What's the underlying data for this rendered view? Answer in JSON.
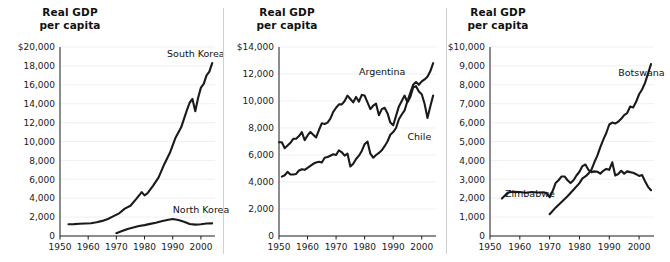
{
  "figure": {
    "background": "#ffffff",
    "line_color": "#1a1a1a",
    "grid_color": "#e9e9ef",
    "axis_color": "#1a1a1a"
  },
  "panels": [
    {
      "id": "korea",
      "title": "Real GDP\nper capita",
      "chart_data": {
        "type": "line",
        "title": "Real GDP per capita",
        "xlabel": "",
        "ylabel": "Real GDP per capita",
        "xlim": [
          1950,
          2005
        ],
        "ylim": [
          0,
          20000
        ],
        "xticks": [
          1950,
          1960,
          1970,
          1980,
          1990,
          2000
        ],
        "xtick_labels": [
          "1950",
          "1960",
          "1970",
          "1980",
          "1990",
          "2000"
        ],
        "yticks": [
          0,
          2000,
          4000,
          6000,
          8000,
          10000,
          12000,
          14000,
          16000,
          18000,
          20000
        ],
        "ytick_labels": [
          "0",
          "2,000",
          "4,000",
          "6,000",
          "8,000",
          "10,000",
          "12,000",
          "14,000",
          "16,000",
          "18,000",
          "$20,000"
        ],
        "grid": true,
        "legend": "inline-annotations",
        "series": [
          {
            "name": "South Korea",
            "label_x": 1988,
            "label_y": 18900,
            "x": [
              1953,
              1955,
              1957,
              1959,
              1961,
              1963,
              1965,
              1967,
              1969,
              1971,
              1973,
              1975,
              1977,
              1979,
              1980,
              1981,
              1983,
              1985,
              1987,
              1989,
              1991,
              1993,
              1995,
              1996,
              1997,
              1998,
              1999,
              2000,
              2001,
              2002,
              2003,
              2004
            ],
            "y": [
              1250,
              1260,
              1300,
              1320,
              1350,
              1450,
              1600,
              1800,
              2100,
              2400,
              2900,
              3200,
              3900,
              4650,
              4300,
              4500,
              5300,
              6200,
              7600,
              8800,
              10400,
              11500,
              13300,
              14100,
              14500,
              13200,
              14600,
              15700,
              16100,
              17000,
              17400,
              18300
            ]
          },
          {
            "name": "North Korea",
            "label_x": 1990,
            "label_y": 2450,
            "x": [
              1970,
              1972,
              1974,
              1976,
              1978,
              1980,
              1982,
              1984,
              1986,
              1988,
              1990,
              1992,
              1994,
              1996,
              1998,
              2000,
              2002,
              2004
            ],
            "y": [
              300,
              520,
              750,
              900,
              1050,
              1150,
              1280,
              1400,
              1550,
              1700,
              1800,
              1700,
              1500,
              1270,
              1200,
              1250,
              1320,
              1340
            ]
          }
        ]
      }
    },
    {
      "id": "argentina-chile",
      "title": "Real GDP\nper capita",
      "chart_data": {
        "type": "line",
        "title": "Real GDP per capita",
        "xlabel": "",
        "ylabel": "Real GDP per capita",
        "xlim": [
          1950,
          2005
        ],
        "ylim": [
          0,
          14000
        ],
        "xticks": [
          1950,
          1960,
          1970,
          1980,
          1990,
          2000
        ],
        "xtick_labels": [
          "1950",
          "1960",
          "1970",
          "1980",
          "1990",
          "2000"
        ],
        "yticks": [
          0,
          2000,
          4000,
          6000,
          8000,
          10000,
          12000,
          14000
        ],
        "ytick_labels": [
          "0",
          "2,000",
          "4,000",
          "6,000",
          "8,000",
          "10,000",
          "12,000",
          "$14,000"
        ],
        "grid": true,
        "legend": "inline-annotations",
        "series": [
          {
            "name": "Argentina",
            "label_x": 1978,
            "label_y": 11950,
            "x": [
              1950,
              1951,
              1952,
              1953,
              1954,
              1955,
              1956,
              1957,
              1958,
              1959,
              1960,
              1961,
              1962,
              1963,
              1964,
              1965,
              1966,
              1967,
              1968,
              1969,
              1970,
              1971,
              1972,
              1973,
              1974,
              1975,
              1976,
              1977,
              1978,
              1979,
              1980,
              1981,
              1982,
              1983,
              1984,
              1985,
              1986,
              1987,
              1988,
              1989,
              1990,
              1991,
              1992,
              1993,
              1994,
              1995,
              1996,
              1997,
              1998,
              1999,
              2000,
              2001,
              2002,
              2003,
              2004
            ],
            "y": [
              6950,
              6950,
              6500,
              6700,
              6900,
              7200,
              7200,
              7400,
              7700,
              7100,
              7450,
              7700,
              7500,
              7300,
              7850,
              8350,
              8300,
              8400,
              8700,
              9200,
              9500,
              9750,
              9750,
              10000,
              10400,
              10150,
              9900,
              10300,
              9950,
              10450,
              10400,
              9900,
              9400,
              9650,
              9800,
              8950,
              9400,
              9500,
              9100,
              8400,
              8200,
              8900,
              9600,
              10000,
              10400,
              9900,
              10300,
              11000,
              11100,
              10700,
              10500,
              9800,
              8750,
              9600,
              10400
            ]
          },
          {
            "name": "Chile",
            "label_x": 1995,
            "label_y": 7100,
            "x": [
              1951,
              1952,
              1953,
              1954,
              1955,
              1956,
              1957,
              1958,
              1959,
              1960,
              1961,
              1962,
              1963,
              1964,
              1965,
              1966,
              1967,
              1968,
              1969,
              1970,
              1971,
              1972,
              1973,
              1974,
              1975,
              1976,
              1977,
              1978,
              1979,
              1980,
              1981,
              1982,
              1983,
              1984,
              1985,
              1986,
              1987,
              1988,
              1989,
              1990,
              1991,
              1992,
              1993,
              1994,
              1995,
              1996,
              1997,
              1998,
              1999,
              2000,
              2001,
              2002,
              2003,
              2004
            ],
            "y": [
              4400,
              4500,
              4750,
              4550,
              4550,
              4600,
              4850,
              4950,
              4900,
              5050,
              5200,
              5350,
              5450,
              5500,
              5450,
              5800,
              5850,
              5950,
              6050,
              6000,
              6350,
              6200,
              5950,
              6100,
              5150,
              5350,
              5700,
              5950,
              6300,
              6800,
              7000,
              6100,
              5800,
              6000,
              6150,
              6350,
              6650,
              7000,
              7500,
              7700,
              8000,
              8650,
              9000,
              9300,
              10000,
              10600,
              11200,
              11400,
              11200,
              11450,
              11600,
              11800,
              12200,
              12800
            ]
          }
        ]
      }
    },
    {
      "id": "botswana-zimbabwe",
      "title": "Real GDP\nper capita",
      "chart_data": {
        "type": "line",
        "title": "Real GDP per capita",
        "xlabel": "",
        "ylabel": "Real GDP per capita",
        "xlim": [
          1950,
          2005
        ],
        "ylim": [
          0,
          10000
        ],
        "xticks": [
          1950,
          1960,
          1970,
          1980,
          1990,
          2000
        ],
        "xtick_labels": [
          "1950",
          "1960",
          "1970",
          "1980",
          "1990",
          "2000"
        ],
        "yticks": [
          0,
          1000,
          2000,
          3000,
          4000,
          5000,
          6000,
          7000,
          8000,
          9000,
          10000
        ],
        "ytick_labels": [
          "0",
          "1,000",
          "2,000",
          "3,000",
          "4,000",
          "5,000",
          "6,000",
          "7,000",
          "8,000",
          "9,000",
          "$10,000"
        ],
        "grid": true,
        "legend": "inline-annotations",
        "series": [
          {
            "name": "Zimbabwe",
            "label_x": 1955,
            "label_y": 2050,
            "x": [
              1954,
              1956,
              1958,
              1960,
              1962,
              1964,
              1966,
              1968,
              1969,
              1970,
              1971,
              1972,
              1973,
              1974,
              1975,
              1976,
              1977,
              1978,
              1979,
              1980,
              1981,
              1982,
              1983,
              1984,
              1985,
              1986,
              1987,
              1988,
              1989,
              1990,
              1991,
              1992,
              1993,
              1994,
              1995,
              1996,
              1997,
              1998,
              1999,
              2000,
              2001,
              2002,
              2003,
              2004
            ],
            "y": [
              1980,
              2300,
              2340,
              2330,
              2290,
              2330,
              2300,
              2310,
              2280,
              2050,
              2380,
              2800,
              2950,
              3150,
              3150,
              2950,
              2800,
              2950,
              3200,
              3400,
              3700,
              3780,
              3500,
              3380,
              3420,
              3400,
              3300,
              3450,
              3550,
              3500,
              3900,
              3200,
              3280,
              3450,
              3300,
              3420,
              3380,
              3350,
              3270,
              3180,
              3230,
              2900,
              2600,
              2420
            ]
          },
          {
            "name": "Botswana",
            "label_x": 1993,
            "label_y": 8450,
            "x": [
              1970,
              1972,
              1974,
              1976,
              1978,
              1980,
              1981,
              1982,
              1983,
              1984,
              1985,
              1986,
              1987,
              1988,
              1989,
              1990,
              1991,
              1992,
              1993,
              1994,
              1995,
              1996,
              1997,
              1998,
              1999,
              2000,
              2001,
              2002,
              2003,
              2004
            ],
            "y": [
              1150,
              1500,
              1800,
              2100,
              2450,
              2800,
              3050,
              3150,
              3300,
              3500,
              3900,
              4250,
              4700,
              5100,
              5450,
              5900,
              6000,
              5950,
              6050,
              6200,
              6400,
              6500,
              6850,
              6800,
              7100,
              7500,
              7750,
              8100,
              8600,
              9100
            ]
          }
        ]
      }
    }
  ]
}
